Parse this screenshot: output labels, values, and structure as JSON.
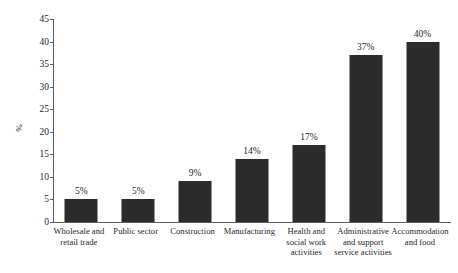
{
  "chart_data": {
    "type": "bar",
    "title": "",
    "subtitle": "",
    "xlabel": "",
    "ylabel": "%",
    "ylim": [
      0,
      45
    ],
    "yticks": [
      0,
      5,
      10,
      15,
      20,
      25,
      30,
      35,
      40,
      45
    ],
    "ytick_labels": [
      "0",
      "5",
      "10",
      "15",
      "20",
      "25",
      "30",
      "35",
      "40",
      "45"
    ],
    "grid": false,
    "legend": null,
    "legend_position": "none",
    "bar_color": "#2b2b2b",
    "axis_color": "#5a5a5a",
    "background_color": "#ffffff",
    "categories": [
      "Wholesale and retail trade",
      "Public sector",
      "Construction",
      "Manufacturing",
      "Health and social work activities",
      "Administrative and support service activities",
      "Accommodation and food"
    ],
    "category_lines": [
      [
        "Wholesale and",
        "retail trade"
      ],
      [
        "Public sector"
      ],
      [
        "Construction"
      ],
      [
        "Manufacturing"
      ],
      [
        "Health and",
        "social work",
        "activities"
      ],
      [
        "Administrative",
        "and support",
        "service activities"
      ],
      [
        "Accommodation",
        "and food"
      ]
    ],
    "values": [
      5,
      5,
      9,
      14,
      17,
      37,
      40
    ],
    "data_labels": [
      "5%",
      "5%",
      "9%",
      "14%",
      "17%",
      "37%",
      "40%"
    ]
  }
}
